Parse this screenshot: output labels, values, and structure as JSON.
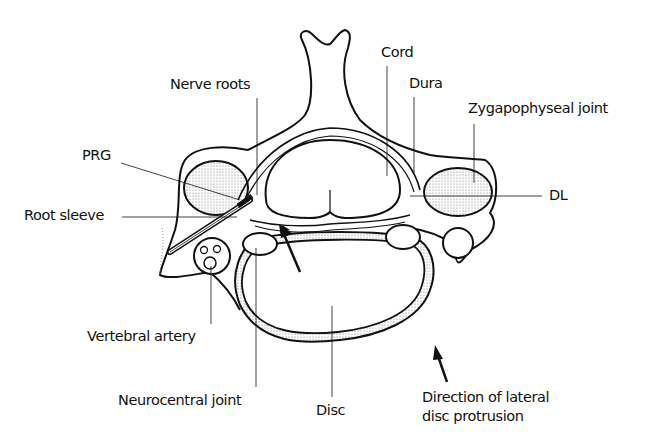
{
  "diagram": {
    "colors": {
      "ink": "#111111",
      "background": "#ffffff",
      "stipple": "#888888"
    },
    "labels": {
      "nerve_roots": "Nerve roots",
      "cord": "Cord",
      "dura": "Dura",
      "zygapophyseal_joint": "Zygapophyseal joint",
      "prg": "PRG",
      "root_sleeve": "Root sleeve",
      "dl": "DL",
      "vertebral_artery": "Vertebral artery",
      "neurocentral_joint": "Neurocentral joint",
      "disc": "Disc",
      "direction_line1": "Direction of lateral",
      "direction_line2": "disc protrusion"
    }
  }
}
